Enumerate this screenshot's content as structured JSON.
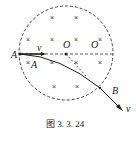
{
  "figure": {
    "caption": "图 3. 3. 24",
    "labels": {
      "point_A": "A",
      "point_A_inner": "A",
      "velocity_entry": "v",
      "center_O": "O",
      "center_O_second": "O",
      "point_B": "B",
      "velocity_exit": "v"
    },
    "field_marker": "×",
    "field_marker_positions": [
      [
        52,
        20
      ],
      [
        76,
        20
      ],
      [
        28,
        42
      ],
      [
        52,
        42
      ],
      [
        76,
        42
      ],
      [
        100,
        42
      ],
      [
        28,
        65
      ],
      [
        52,
        65
      ],
      [
        76,
        65
      ],
      [
        100,
        65
      ],
      [
        54,
        89
      ],
      [
        77,
        89
      ]
    ],
    "note": "Second O and inner A are likely O′ and A′ in the source figure; primes not legible at this resolution.",
    "colors": {
      "ink": "#222222",
      "background": "#ffffff"
    }
  }
}
